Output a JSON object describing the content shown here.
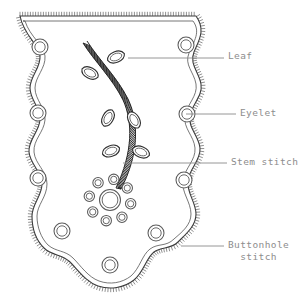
{
  "figure": {
    "background_color": "#ffffff",
    "outline_color": "#3a3a3a",
    "label_color": "#8d8d8d",
    "leader_color": "#8a8a8a"
  },
  "labels": [
    {
      "id": "leaf",
      "text": "Leaf",
      "leader_from": [
        128,
        58
      ],
      "leader_to": [
        224,
        58
      ]
    },
    {
      "id": "eyelet",
      "text": "Eyelet",
      "leader_from": [
        186,
        114
      ],
      "leader_to": [
        236,
        114
      ]
    },
    {
      "id": "stem_stitch",
      "text": "Stem stitch",
      "leader_from": [
        123,
        163
      ],
      "leader_to": [
        227,
        163
      ]
    },
    {
      "id": "buttonhole_stitch",
      "text": "Buttonhole",
      "text_line2": "stitch",
      "leader_from": [
        181,
        246
      ],
      "leader_to": [
        224,
        246
      ]
    }
  ],
  "motifs": {
    "eyelets_scattered": [
      [
        40,
        47
      ],
      [
        186,
        45
      ],
      [
        38,
        113
      ],
      [
        187,
        114
      ],
      [
        38,
        178
      ],
      [
        184,
        180
      ],
      [
        62,
        231
      ],
      [
        156,
        233
      ],
      [
        110,
        265
      ]
    ],
    "flower": {
      "center": [
        110,
        200
      ],
      "center_radius": 10.5,
      "petal_radius": 5.2,
      "petal_count": 8,
      "petal_ring_radius": 21
    },
    "leaves": [
      {
        "x": 116,
        "y": 57,
        "angle": -22
      },
      {
        "x": 90,
        "y": 73,
        "angle": 28
      },
      {
        "x": 108,
        "y": 118,
        "angle": -62
      },
      {
        "x": 134,
        "y": 120,
        "angle": 60
      },
      {
        "x": 111,
        "y": 151,
        "angle": -20
      },
      {
        "x": 141,
        "y": 152,
        "angle": 22
      }
    ],
    "stem": {
      "description": "stem stitch rope curve from upper-left to flower center",
      "start": [
        84,
        44
      ],
      "end": [
        117,
        188
      ]
    }
  }
}
